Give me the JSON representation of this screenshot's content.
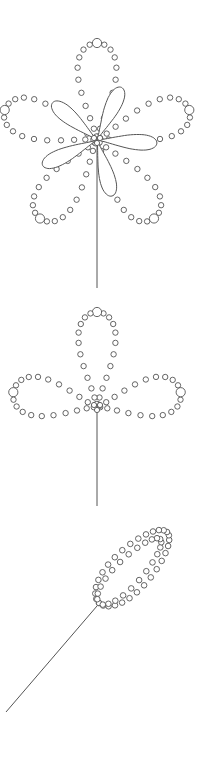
{
  "diagram": {
    "width": 215,
    "height": 762,
    "background": "#ffffff",
    "stroke": "#555555",
    "figures": [
      {
        "name": "five-petal-flower",
        "center": [
          97,
          140
        ],
        "stem": {
          "from": [
            97,
            143
          ],
          "to": [
            97,
            288
          ]
        },
        "bead_loops": [
          {
            "angle": -90,
            "length": 97,
            "width": 50,
            "beads": 22
          },
          {
            "angle": -18,
            "length": 97,
            "width": 50,
            "beads": 22
          },
          {
            "angle": 54,
            "length": 97,
            "width": 50,
            "beads": 22
          },
          {
            "angle": 126,
            "length": 97,
            "width": 50,
            "beads": 22
          },
          {
            "angle": 198,
            "length": 97,
            "width": 50,
            "beads": 22
          }
        ],
        "inner_petals": [
          {
            "angle": -65,
            "length": 58,
            "width": 20
          },
          {
            "angle": 3,
            "length": 60,
            "width": 20
          },
          {
            "angle": 75,
            "length": 58,
            "width": 20
          },
          {
            "angle": 155,
            "length": 60,
            "width": 20
          },
          {
            "angle": 220,
            "length": 58,
            "width": 20
          }
        ]
      },
      {
        "name": "three-petal-bud",
        "center": [
          97,
          407
        ],
        "stem": {
          "from": [
            97,
            412
          ],
          "to": [
            97,
            506
          ]
        },
        "bead_loops": [
          {
            "angle": -90,
            "length": 95,
            "width": 48,
            "beads": 24
          },
          {
            "angle": -10,
            "length": 85,
            "width": 50,
            "beads": 22
          },
          {
            "angle": 190,
            "length": 85,
            "width": 50,
            "beads": 22
          }
        ],
        "inner_petals": []
      },
      {
        "name": "beaded-leaf",
        "leaf": {
          "base": [
            99,
            603
          ],
          "tip": [
            167,
            532
          ],
          "outer_width": 46,
          "inner_width": 30,
          "beads_outer": 30,
          "beads_inner": 24
        },
        "stem": {
          "from": [
            97,
            606
          ],
          "to": [
            6,
            712
          ]
        }
      }
    ]
  }
}
